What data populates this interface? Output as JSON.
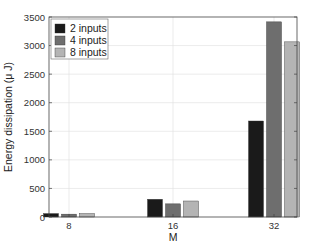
{
  "chart_data": {
    "type": "bar",
    "title": "",
    "xlabel": "M",
    "ylabel": "Energy dissipation (μ J)",
    "categories": [
      "8",
      "16",
      "32"
    ],
    "series": [
      {
        "name": "2 inputs",
        "color": "#1a1a1a",
        "values": [
          60,
          310,
          1680
        ]
      },
      {
        "name": "4 inputs",
        "color": "#6e6e6e",
        "values": [
          50,
          230,
          3415
        ]
      },
      {
        "name": "8 inputs",
        "color": "#b4b4b4",
        "values": [
          60,
          280,
          3065
        ]
      }
    ],
    "ylim": [
      0,
      3500
    ],
    "yticks": [
      0,
      500,
      1000,
      1500,
      2000,
      2500,
      3000,
      3500
    ],
    "grid": true,
    "legend_position": "upper left"
  },
  "plot": {
    "left": 49,
    "top": 17,
    "right": 297,
    "bottom": 217
  }
}
